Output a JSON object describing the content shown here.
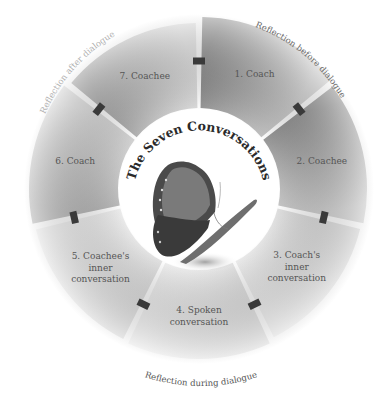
{
  "title": "The Seven Conversations",
  "center_image": "butterfly-illustration",
  "segments": [
    {
      "label_lines": [
        "1. Coach"
      ],
      "color": "#8a8a8a",
      "color_light": "#cfcfcf"
    },
    {
      "label_lines": [
        "2. Coachee"
      ],
      "color": "#8f8f8f",
      "color_light": "#d2d2d2"
    },
    {
      "label_lines": [
        "3. Coach's",
        "inner",
        "conversation"
      ],
      "color": "#dedede",
      "color_light": "#f0f0f0"
    },
    {
      "label_lines": [
        "4.  Spoken",
        "conversation"
      ],
      "color": "#e2e2e2",
      "color_light": "#f2f2f2"
    },
    {
      "label_lines": [
        "5. Coachee's",
        "inner",
        "conversation"
      ],
      "color": "#e0e0e0",
      "color_light": "#f1f1f1"
    },
    {
      "label_lines": [
        "6. Coach"
      ],
      "color": "#b5b5b5",
      "color_light": "#dcdcdc"
    },
    {
      "label_lines": [
        "7. Coachee"
      ],
      "color": "#aaaaaa",
      "color_light": "#e4e4e4"
    }
  ],
  "arc_labels": {
    "before": "Reflection before dialogue",
    "during": "Reflection during dialogue",
    "after": "Reflection after dialogue"
  },
  "colors": {
    "tab": "#3a3a3a",
    "text": "#555555",
    "arc_text": "#6a6a6a",
    "arc_text_faint": "#b0b0b0",
    "title": "#2a2a2a"
  }
}
